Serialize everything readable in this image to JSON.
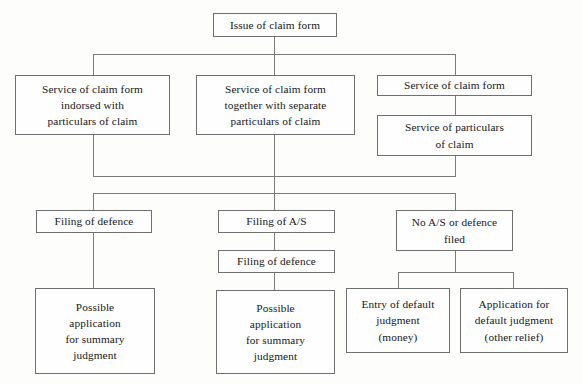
{
  "diagram": {
    "line_color": "#7b7b7b",
    "border_color": "#6f6f6f",
    "background_color": "#fdfdfc",
    "text_color": "#171717"
  },
  "nodes": {
    "issue_claim_form": {
      "lines": [
        "Issue of claim form"
      ]
    },
    "service_indorsed": {
      "lines": [
        "Service of claim form",
        "indorsed with",
        "particulars of claim"
      ]
    },
    "service_together_separate": {
      "lines": [
        "Service of claim form",
        "together with separate",
        "particulars of claim"
      ]
    },
    "service_claim_form": {
      "lines": [
        "Service of claim form"
      ]
    },
    "service_particulars": {
      "lines": [
        "Service of particulars",
        "of claim"
      ]
    },
    "filing_defence_left": {
      "lines": [
        "Filing of defence"
      ]
    },
    "filing_as": {
      "lines": [
        "Filing of A/S"
      ]
    },
    "filing_defence_middle": {
      "lines": [
        "Filing of defence"
      ]
    },
    "no_as_or_defence": {
      "lines": [
        "No A/S or defence",
        "filed"
      ]
    },
    "summary_judgment_left": {
      "lines": [
        "Possible",
        "application",
        "for summary",
        "judgment"
      ]
    },
    "summary_judgment_middle": {
      "lines": [
        "Possible",
        "application",
        "for summary",
        "judgment"
      ]
    },
    "entry_default_judgment": {
      "lines": [
        "Entry of default",
        "judgment",
        "(money)"
      ]
    },
    "application_default_judgment": {
      "lines": [
        "Application for",
        "default judgment",
        "(other relief)"
      ]
    }
  }
}
